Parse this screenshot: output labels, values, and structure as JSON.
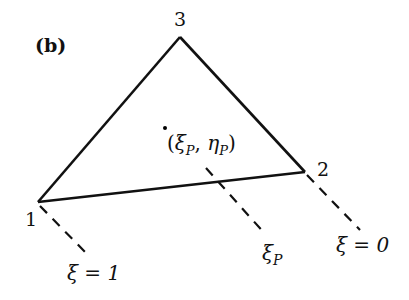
{
  "panel_label": "(b)",
  "vertices": [
    {
      "id": "1",
      "label": "1",
      "x": 38,
      "y": 202
    },
    {
      "id": "2",
      "label": "2",
      "x": 305,
      "y": 172
    },
    {
      "id": "3",
      "label": "3",
      "x": 180,
      "y": 37
    }
  ],
  "point": {
    "label_xi": "ξ",
    "label_eta": "η",
    "sub": "P",
    "open": "(",
    "comma": ", ",
    "close": ")",
    "x": 165,
    "y": 128
  },
  "dashed_lines": [
    {
      "label_main": "ξ = 1",
      "name": "xi-equals-1"
    },
    {
      "label_main": "ξ",
      "label_sub": "P",
      "name": "xi-p"
    },
    {
      "label_main": "ξ = 0",
      "name": "xi-equals-0"
    }
  ],
  "colors": {
    "stroke": "#111111",
    "background": "#ffffff"
  }
}
